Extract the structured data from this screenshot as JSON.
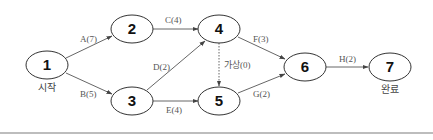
{
  "diagram": {
    "type": "activity-on-arrow network",
    "nodes": [
      {
        "id": "1",
        "label": "1",
        "sublabel": "시작"
      },
      {
        "id": "2",
        "label": "2"
      },
      {
        "id": "3",
        "label": "3"
      },
      {
        "id": "4",
        "label": "4"
      },
      {
        "id": "5",
        "label": "5"
      },
      {
        "id": "6",
        "label": "6"
      },
      {
        "id": "7",
        "label": "7",
        "sublabel": "완료"
      }
    ],
    "edges": [
      {
        "from": "1",
        "to": "2",
        "label": "A(7)",
        "style": "solid"
      },
      {
        "from": "1",
        "to": "3",
        "label": "B(5)",
        "style": "solid"
      },
      {
        "from": "2",
        "to": "4",
        "label": "C(4)",
        "style": "solid"
      },
      {
        "from": "3",
        "to": "4",
        "label": "D(2)",
        "style": "solid"
      },
      {
        "from": "3",
        "to": "5",
        "label": "E(4)",
        "style": "solid"
      },
      {
        "from": "4",
        "to": "6",
        "label": "F(3)",
        "style": "solid"
      },
      {
        "from": "4",
        "to": "5",
        "label": "가상(0)",
        "style": "dotted"
      },
      {
        "from": "5",
        "to": "6",
        "label": "G(2)",
        "style": "solid"
      },
      {
        "from": "6",
        "to": "7",
        "label": "H(2)",
        "style": "solid"
      }
    ]
  }
}
